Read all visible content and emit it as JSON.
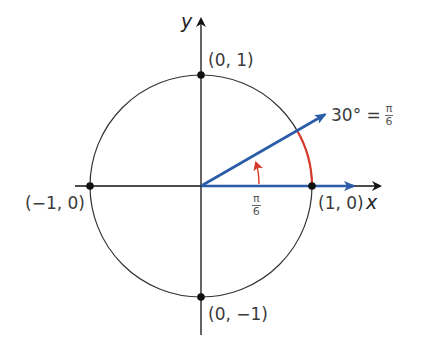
{
  "diagram": {
    "type": "unit-circle",
    "axes": {
      "x_label": "x",
      "y_label": "y"
    },
    "points": [
      {
        "name": "top",
        "label": "(0, 1)"
      },
      {
        "name": "left",
        "label": "(−1, 0)"
      },
      {
        "name": "right",
        "label": "(1, 0)"
      },
      {
        "name": "bottom",
        "label": "(0, −1)"
      }
    ],
    "angle_label": {
      "degrees": "30° =",
      "num": "π",
      "den": "6"
    },
    "inner_angle_label": {
      "num": "π",
      "den": "6"
    },
    "colors": {
      "vector": "#2b5ca8",
      "arc": "#d63a2a",
      "axis": "#111111",
      "circle": "#333333"
    }
  }
}
